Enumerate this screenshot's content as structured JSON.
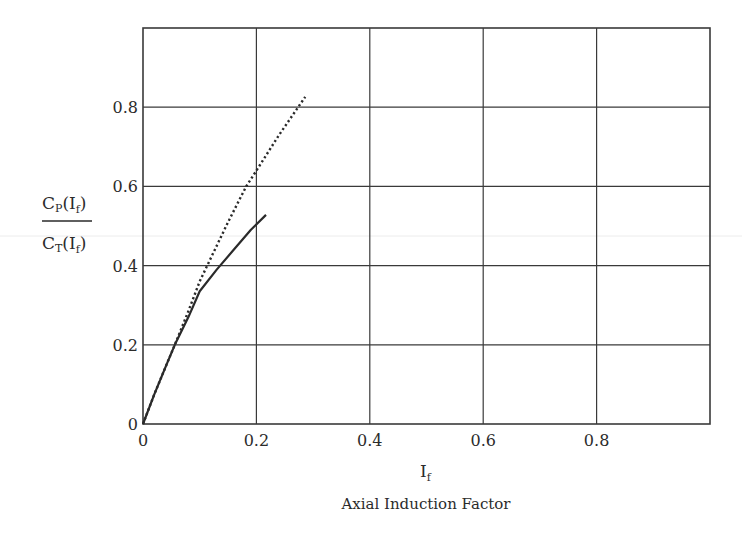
{
  "chart_data": {
    "type": "line",
    "title": "",
    "xlabel": "I_f",
    "xlabel_symbol": "I",
    "xlabel_subscript": "f",
    "xlabel_caption": "Axial Induction Factor",
    "ylabel": "C_P(I_f) / C_T(I_f)",
    "ylabel_numerator": {
      "main": "C",
      "sub": "P",
      "rest": "(I",
      "sub2": "f",
      "close": ")"
    },
    "ylabel_denominator": {
      "main": "C",
      "sub": "T",
      "rest": "(I",
      "sub2": "f",
      "close": ")"
    },
    "xlim": [
      0,
      1.0
    ],
    "ylim": [
      0,
      1.0
    ],
    "grid": true,
    "legend": null,
    "x_ticks": [
      0,
      0.2,
      0.4,
      0.6,
      0.8
    ],
    "x_tick_labels": [
      "0",
      "0.2",
      "0.4",
      "0.6",
      "0.8"
    ],
    "y_ticks": [
      0,
      0.2,
      0.4,
      0.6,
      0.8
    ],
    "y_tick_labels": [
      "0",
      "0.2",
      "0.4",
      "0.6",
      "0.8"
    ],
    "series": [
      {
        "name": "C_P(I_f)",
        "style": "solid",
        "color": "#2a2a2a",
        "x": [
          0,
          0.02,
          0.04,
          0.056,
          0.08,
          0.1,
          0.13,
          0.16,
          0.19,
          0.217
        ],
        "y": [
          0,
          0.075,
          0.145,
          0.2,
          0.27,
          0.335,
          0.39,
          0.44,
          0.49,
          0.528
        ]
      },
      {
        "name": "C_T(I_f)",
        "style": "dotted",
        "color": "#2a2a2a",
        "x": [
          0,
          0.02,
          0.04,
          0.056,
          0.08,
          0.1,
          0.12,
          0.15,
          0.182,
          0.2,
          0.24,
          0.286
        ],
        "y": [
          0,
          0.075,
          0.145,
          0.2,
          0.285,
          0.36,
          0.42,
          0.51,
          0.6,
          0.64,
          0.73,
          0.826
        ]
      }
    ]
  },
  "plot_area": {
    "left": 143,
    "top": 28,
    "right": 710,
    "bottom": 424
  },
  "colors": {
    "grid": "#3a3a3a",
    "line": "#2a2a2a",
    "background": "#ffffff"
  }
}
